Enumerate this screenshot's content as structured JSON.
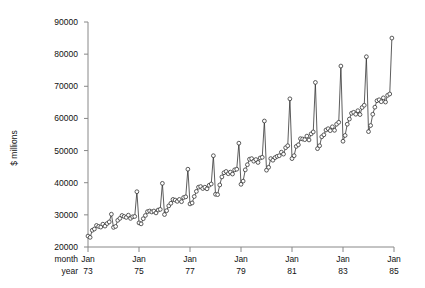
{
  "chart_data": {
    "type": "line",
    "title": "",
    "subtitle": "",
    "xlabel": "",
    "ylabel": "$ millions",
    "row_labels": [
      "month",
      "year"
    ],
    "ylim": [
      20000,
      90000
    ],
    "ytick_values": [
      20000,
      30000,
      40000,
      50000,
      60000,
      70000,
      80000,
      90000
    ],
    "ytick_labels": [
      "20000",
      "30000",
      "40000",
      "50000",
      "60000",
      "70000",
      "80000",
      "90000"
    ],
    "xtick_months": [
      "Jan",
      "Jan",
      "Jan",
      "Jan",
      "Jan",
      "Jan",
      "Jan"
    ],
    "xtick_years": [
      "73",
      "75",
      "77",
      "79",
      "81",
      "83",
      "85"
    ],
    "xtick_x": [
      1973.0,
      1975.0,
      1977.0,
      1979.0,
      1981.0,
      1983.0,
      1985.0
    ],
    "xlim": [
      1973.0,
      1985.0
    ],
    "grid": false,
    "legend": null,
    "marker": "open-circle",
    "line_color": "#333333",
    "marker_color": "#333333",
    "axis_color": "#888888",
    "series": [
      {
        "name": "Retail sales",
        "x": [
          1973.0,
          1973.083,
          1973.167,
          1973.25,
          1973.333,
          1973.417,
          1973.5,
          1973.583,
          1973.667,
          1973.75,
          1973.833,
          1973.917,
          1974.0,
          1974.083,
          1974.167,
          1974.25,
          1974.333,
          1974.417,
          1974.5,
          1974.583,
          1974.667,
          1974.75,
          1974.833,
          1974.917,
          1975.0,
          1975.083,
          1975.167,
          1975.25,
          1975.333,
          1975.417,
          1975.5,
          1975.583,
          1975.667,
          1975.75,
          1975.833,
          1975.917,
          1976.0,
          1976.083,
          1976.167,
          1976.25,
          1976.333,
          1976.417,
          1976.5,
          1976.583,
          1976.667,
          1976.75,
          1976.833,
          1976.917,
          1977.0,
          1977.083,
          1977.167,
          1977.25,
          1977.333,
          1977.417,
          1977.5,
          1977.583,
          1977.667,
          1977.75,
          1977.833,
          1977.917,
          1978.0,
          1978.083,
          1978.167,
          1978.25,
          1978.333,
          1978.417,
          1978.5,
          1978.583,
          1978.667,
          1978.75,
          1978.833,
          1978.917,
          1979.0,
          1979.083,
          1979.167,
          1979.25,
          1979.333,
          1979.417,
          1979.5,
          1979.583,
          1979.667,
          1979.75,
          1979.833,
          1979.917,
          1980.0,
          1980.083,
          1980.167,
          1980.25,
          1980.333,
          1980.417,
          1980.5,
          1980.583,
          1980.667,
          1980.75,
          1980.833,
          1980.917,
          1981.0,
          1981.083,
          1981.167,
          1981.25,
          1981.333,
          1981.417,
          1981.5,
          1981.583,
          1981.667,
          1981.75,
          1981.833,
          1981.917,
          1982.0,
          1982.083,
          1982.167,
          1982.25,
          1982.333,
          1982.417,
          1982.5,
          1982.583,
          1982.667,
          1982.75,
          1982.833,
          1982.917,
          1983.0,
          1983.083,
          1983.167,
          1983.25,
          1983.333,
          1983.417,
          1983.5,
          1983.583,
          1983.667,
          1983.75,
          1983.833,
          1983.917,
          1984.0,
          1984.083,
          1984.167,
          1984.25,
          1984.333,
          1984.417,
          1984.5,
          1984.583,
          1984.667,
          1984.75,
          1984.833,
          1984.917
        ],
        "values": [
          23400,
          23000,
          25200,
          25600,
          26700,
          26400,
          26200,
          27100,
          26500,
          27300,
          27800,
          30200,
          26100,
          26400,
          28300,
          28900,
          29800,
          29500,
          29200,
          29900,
          28900,
          29400,
          29500,
          37200,
          27500,
          27200,
          28800,
          29800,
          31000,
          31200,
          30900,
          31200,
          30600,
          31500,
          31700,
          39800,
          30100,
          31300,
          32800,
          33600,
          34800,
          34600,
          34200,
          34800,
          34100,
          35400,
          35600,
          44200,
          33400,
          33700,
          35700,
          37300,
          38600,
          38800,
          38200,
          38600,
          38100,
          39200,
          39600,
          48400,
          36400,
          36300,
          39300,
          41800,
          43100,
          43500,
          42800,
          43300,
          42700,
          44000,
          44200,
          52300,
          39500,
          40500,
          44000,
          45600,
          47300,
          47500,
          46700,
          47200,
          46300,
          47700,
          47900,
          59200,
          43900,
          44800,
          47500,
          47000,
          47800,
          48200,
          48400,
          49500,
          48900,
          50900,
          51500,
          66100,
          47500,
          48400,
          51300,
          51800,
          53700,
          53600,
          53400,
          54500,
          53300,
          55200,
          55800,
          71200,
          50600,
          51500,
          54300,
          54900,
          56400,
          56800,
          56200,
          57400,
          56300,
          58200,
          58800,
          76300,
          52900,
          54700,
          58200,
          59800,
          61600,
          61900,
          61300,
          62400,
          61200,
          63400,
          64100,
          79200,
          55900,
          57800,
          61300,
          63500,
          65500,
          65800,
          65200,
          66400,
          65100,
          67200,
          67600,
          85000
        ]
      }
    ]
  },
  "axis": {
    "ylabel": "$ millions",
    "month_row_label": "month",
    "year_row_label": "year"
  }
}
